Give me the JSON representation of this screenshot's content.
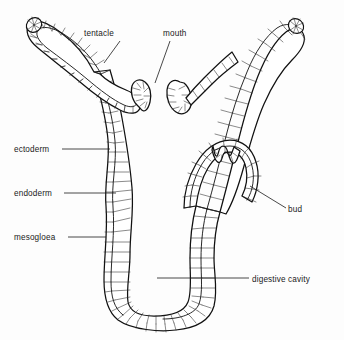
{
  "figure": {
    "background_color": "#fdfdfd",
    "ink_color": "#111111"
  },
  "labels": [
    {
      "id": "tentacle",
      "text": "tentacle",
      "side": "top-left",
      "text_x": 84,
      "text_y": 36,
      "leader": "M 120 41 L 104 63"
    },
    {
      "id": "mouth",
      "text": "mouth",
      "side": "top-right",
      "text_x": 163,
      "text_y": 36,
      "leader": "M 170 41 L 155 83"
    },
    {
      "id": "ectoderm",
      "text": "ectoderm",
      "side": "left",
      "text_x": 14,
      "text_y": 152,
      "leader": "M 62 149 L 110 149"
    },
    {
      "id": "endoderm",
      "text": "endoderm",
      "side": "left",
      "text_x": 14,
      "text_y": 196,
      "leader": "M 64 193 L 116 193"
    },
    {
      "id": "mesogloea",
      "text": "mesogloea",
      "side": "left",
      "text_x": 14,
      "text_y": 240,
      "leader": "M 68 237 L 106 237"
    },
    {
      "id": "bud",
      "text": "bud",
      "side": "right",
      "text_x": 288,
      "text_y": 212,
      "leader": "M 286 208 L 250 186"
    },
    {
      "id": "digestive-cavity",
      "text": "digestive cavity",
      "side": "right",
      "text_x": 252,
      "text_y": 282,
      "leader": "M 249 278 L 157 278"
    }
  ]
}
